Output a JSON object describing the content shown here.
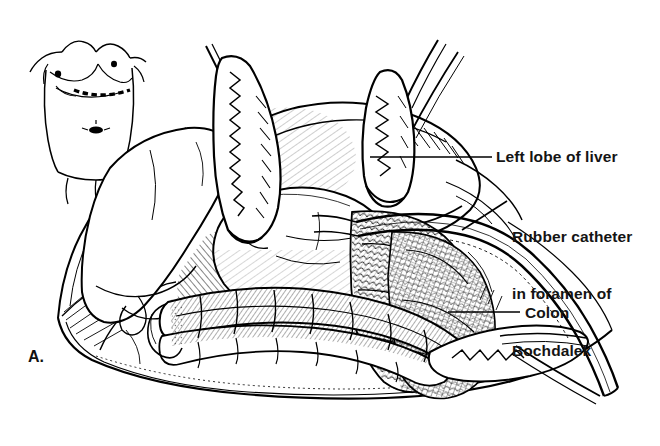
{
  "figure": {
    "panel_letter": "A.",
    "background_color": "#ffffff",
    "ink_color": "#000000",
    "width": 660,
    "height": 446,
    "caption_style": "bold-sans"
  },
  "annotations": [
    {
      "id": "left-lobe-of-liver",
      "text": "Left lobe of liver",
      "lines": [
        "Left lobe of liver"
      ],
      "text_x": 496,
      "text_y": 147,
      "leader": {
        "x1": 492,
        "y1": 157,
        "x2": 370,
        "y2": 157
      }
    },
    {
      "id": "rubber-catheter-foramen-bochdalek",
      "text": "Rubber catheter in foramen of Bochdalek",
      "lines": [
        "Rubber catheter",
        "in foramen of",
        "Bochdalek"
      ],
      "text_x": 512,
      "text_y": 189,
      "leader": {
        "x1": 507,
        "y1": 201,
        "x2": 462,
        "y2": 230
      }
    },
    {
      "id": "colon",
      "text": "Colon",
      "lines": [
        "Colon"
      ],
      "text_x": 525,
      "text_y": 303,
      "leader": {
        "x1": 520,
        "y1": 312,
        "x2": 448,
        "y2": 312
      }
    }
  ],
  "inset": {
    "name": "body-habitus-incision-inset",
    "description": "Infant torso, anterior view, with dashed left subcostal incision marking",
    "bounds": {
      "x": 36,
      "y": 34,
      "width": 100,
      "height": 140
    },
    "features": [
      "nipples",
      "dashed-incision-line",
      "umbilicus",
      "arms",
      "legs"
    ]
  },
  "anatomy": [
    {
      "id": "right-lobe-liver",
      "label": "Right lobe of liver"
    },
    {
      "id": "left-lobe-liver",
      "label": "Left lobe of liver"
    },
    {
      "id": "stomach",
      "label": "Stomach"
    },
    {
      "id": "transverse-colon",
      "label": "Colon"
    },
    {
      "id": "small-bowel",
      "label": "Small bowel"
    },
    {
      "id": "omentum",
      "label": "Omentum"
    },
    {
      "id": "abdominal-wall",
      "label": "Abdominal wall / wound edge"
    }
  ],
  "instruments": [
    {
      "id": "retractor-upper-left",
      "label": "Malleable retractor"
    },
    {
      "id": "retractor-upper-right",
      "label": "Malleable retractor"
    },
    {
      "id": "retractor-lower-right",
      "label": "Malleable retractor"
    },
    {
      "id": "rubber-catheter",
      "label": "Rubber catheter"
    }
  ]
}
